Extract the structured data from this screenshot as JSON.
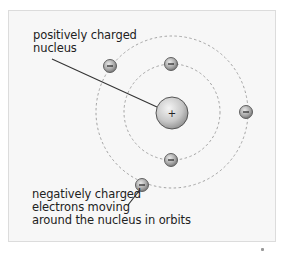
{
  "diagram": {
    "labels": {
      "nucleus": {
        "lines": [
          "positively charged",
          "nucleus"
        ]
      },
      "electrons": {
        "lines": [
          "negatively charged",
          "electrons moving",
          "around the nucleus in orbits"
        ]
      }
    },
    "nucleus": {
      "symbol": "+",
      "cx": 172,
      "cy": 113,
      "r": 16
    },
    "orbits": [
      {
        "name": "inner-orbit",
        "cx": 172,
        "cy": 112,
        "r": 48
      },
      {
        "name": "outer-orbit",
        "cx": 172,
        "cy": 112,
        "r": 76
      }
    ],
    "electrons": [
      {
        "symbol": "−",
        "cx": 171,
        "cy": 64,
        "orbit": "inner"
      },
      {
        "symbol": "−",
        "cx": 171,
        "cy": 160,
        "orbit": "inner"
      },
      {
        "symbol": "−",
        "cx": 110,
        "cy": 66,
        "orbit": "outer"
      },
      {
        "symbol": "−",
        "cx": 246,
        "cy": 112,
        "orbit": "outer"
      },
      {
        "symbol": "−",
        "cx": 142,
        "cy": 185,
        "orbit": "outer"
      }
    ],
    "colors": {
      "panel_bg": "#f7f7f7",
      "panel_border": "#dcdcdc",
      "orbit_stroke": "#9a9a9a",
      "particle_fill_light": "#e6e6e6",
      "particle_fill_dark": "#8a8a8a",
      "particle_stroke": "#555555",
      "leader_line": "#333333",
      "text": "#222222"
    }
  }
}
